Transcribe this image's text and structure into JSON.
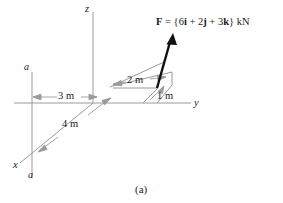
{
  "figure": {
    "caption": "(a)",
    "axes": [
      {
        "name": "z-axis-label",
        "label": "z"
      },
      {
        "name": "y-axis-label",
        "label": "y"
      },
      {
        "name": "x-axis-label",
        "label": "x"
      }
    ],
    "section_marks": [
      {
        "name": "section-label-a-top",
        "label": "a"
      },
      {
        "name": "section-label-a-bottom",
        "label": "a"
      }
    ],
    "dimensions": [
      {
        "name": "dimension-3m",
        "label": "3 m",
        "value": 3,
        "unit": "m",
        "axis": "y-negative"
      },
      {
        "name": "dimension-2m",
        "label": "2 m",
        "value": 2,
        "unit": "m",
        "axis": "x"
      },
      {
        "name": "dimension-1m",
        "label": "1 m",
        "value": 1,
        "unit": "m",
        "axis": "x"
      },
      {
        "name": "dimension-4m",
        "label": "4 m",
        "value": 4,
        "unit": "m",
        "axis": "x"
      }
    ],
    "force": {
      "symbol": "F",
      "equals": " = ",
      "open_brace": "{",
      "i_coefficient": "6",
      "i_unit": "i",
      "plus_1": " + ",
      "j_coefficient": "2",
      "j_unit": "j",
      "plus_2": " + ",
      "k_coefficient": "3",
      "k_unit": "k",
      "close_brace": "}",
      "units": " kN",
      "full_text": "F = {6i + 2j + 3k} kN"
    },
    "colors": {
      "line": "#9a9a9a",
      "arrow": "#111111",
      "text": "#1a1a1a"
    }
  }
}
